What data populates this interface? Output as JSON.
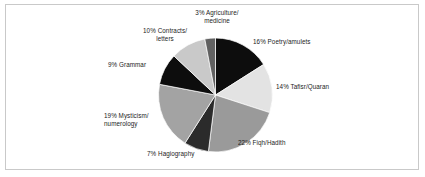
{
  "chart_data": {
    "type": "pie",
    "title": "",
    "subtitle": "",
    "xlabel": "",
    "ylabel": "",
    "legend_position": "none",
    "grid": false,
    "labels_format": "{percent}% {category}",
    "start_angle_deg": 0,
    "direction": "clockwise",
    "categories": [
      "Poetry/amulets",
      "Tafisr/Quaran",
      "Fiqh/Hadith",
      "Hagiography",
      "Mysticism/numerology",
      "Grammar",
      "Contracts/letters",
      "Agriculture/medicine"
    ],
    "values": [
      16,
      14,
      22,
      7,
      19,
      9,
      10,
      3
    ],
    "units": "percent",
    "total": 100,
    "colors": [
      "#0d0d0d",
      "#e3e3e3",
      "#9a9a9a",
      "#2b2b2b",
      "#a3a3a3",
      "#0d0d0d",
      "#c9c9c9",
      "#616161"
    ],
    "slices": [
      {
        "category": "Poetry/amulets",
        "value": 16,
        "color": "#0d0d0d",
        "label": "16% Poetry/amulets"
      },
      {
        "category": "Tafisr/Quaran",
        "value": 14,
        "color": "#e3e3e3",
        "label": "14%  Tafisr/Quaran"
      },
      {
        "category": "Fiqh/Hadith",
        "value": 22,
        "color": "#9a9a9a",
        "label": "22% Fiqh/Hadith"
      },
      {
        "category": "Hagiography",
        "value": 7,
        "color": "#2b2b2b",
        "label": "7% Hagiography"
      },
      {
        "category": "Mysticism/numerology",
        "value": 19,
        "color": "#a3a3a3",
        "label": "19% Mysticism/\nnumerology"
      },
      {
        "category": "Grammar",
        "value": 9,
        "color": "#0d0d0d",
        "label": "9% Grammar"
      },
      {
        "category": "Contracts/letters",
        "value": 10,
        "color": "#c9c9c9",
        "label": "10% Contracts/\nletters"
      },
      {
        "category": "Agriculture/medicine",
        "value": 3,
        "color": "#616161",
        "label": "3% Agriculture/\nmedicine"
      }
    ]
  },
  "labels": {
    "agriculture": "3% Agriculture/\nmedicine",
    "poetry": "16% Poetry/amulets",
    "tafsir": "14%  Tafisr/Quaran",
    "fiqh": "22% Fiqh/Hadith",
    "hagiography": "7% Hagiography",
    "mysticism": "19% Mysticism/\nnumerology",
    "grammar": "9% Grammar",
    "contracts": "10% Contracts/\nletters"
  },
  "style": {
    "border_color": "#c9c9c9",
    "background": "#ffffff",
    "slice_outline": "#ffffff",
    "text_color": "#1c1c1c"
  }
}
